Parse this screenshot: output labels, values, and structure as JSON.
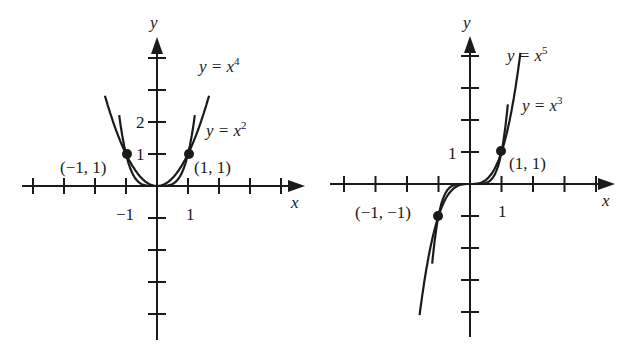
{
  "colors": {
    "ink": "#1a1a1a",
    "background": "#ffffff"
  },
  "chart_data": [
    {
      "type": "line",
      "title": "Even powers",
      "xlabel": "x",
      "ylabel": "y",
      "x_ticks": [
        -4,
        -3,
        -2,
        -1,
        0,
        1,
        2,
        3,
        4
      ],
      "y_ticks": [
        -4,
        -3,
        -2,
        -1,
        0,
        1,
        2,
        3,
        4
      ],
      "x_tick_labels": {
        "-1": "−1",
        "1": "1"
      },
      "y_tick_labels": {
        "1": "1",
        "2": "2"
      },
      "series": [
        {
          "name": "y = x^4",
          "label_base": "y = x",
          "exponent": "4",
          "power": 4,
          "x_range": [
            -1.22,
            1.22
          ]
        },
        {
          "name": "y = x^2",
          "label_base": "y = x",
          "exponent": "2",
          "power": 2,
          "x_range": [
            -1.68,
            1.68
          ]
        }
      ],
      "points": [
        {
          "x": -1,
          "y": 1,
          "label": "(−1, 1)"
        },
        {
          "x": 1,
          "y": 1,
          "label": "(1, 1)"
        }
      ]
    },
    {
      "type": "line",
      "title": "Odd powers",
      "xlabel": "x",
      "ylabel": "y",
      "x_ticks": [
        -4,
        -3,
        -2,
        -1,
        0,
        1,
        2,
        3,
        4
      ],
      "y_ticks": [
        -4,
        -3,
        -2,
        -1,
        0,
        1,
        2,
        3,
        4
      ],
      "x_tick_labels": {
        "1": "1"
      },
      "y_tick_labels": {
        "1": "1"
      },
      "series": [
        {
          "name": "y = x^5",
          "label_base": "y = x",
          "exponent": "5",
          "power": 5,
          "x_range": [
            -1.2,
            1.2
          ]
        },
        {
          "name": "y = x^3",
          "label_base": "y = x",
          "exponent": "3",
          "power": 3,
          "x_range": [
            -1.6,
            1.6
          ]
        }
      ],
      "points": [
        {
          "x": 1,
          "y": 1,
          "label": "(1, 1)"
        },
        {
          "x": -1,
          "y": -1,
          "label": "(−1, −1)"
        }
      ]
    }
  ],
  "labels": {
    "left": {
      "y_axis": "y",
      "x_axis": "x",
      "tick_x_neg1": "−1",
      "tick_x_1": "1",
      "tick_y_1": "1",
      "tick_y_2": "2",
      "curve_x4_base": "y = x",
      "curve_x4_exp": "4",
      "curve_x2_base": "y = x",
      "curve_x2_exp": "2",
      "point_neg": "(−1, 1)",
      "point_pos": "(1, 1)"
    },
    "right": {
      "y_axis": "y",
      "x_axis": "x",
      "tick_x_1": "1",
      "tick_y_1": "1",
      "curve_x5_base": "y = x",
      "curve_x5_exp": "5",
      "curve_x3_base": "y = x",
      "curve_x3_exp": "3",
      "point_pos": "(1, 1)",
      "point_neg": "(−1, −1)"
    }
  }
}
